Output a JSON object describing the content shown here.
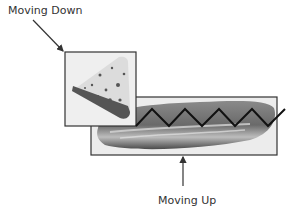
{
  "labels": {
    "top": "Moving Down",
    "bottom": "Moving Up"
  },
  "images": {
    "top_image": "cheese-wedge",
    "bottom_image": "bread-loaf"
  },
  "colors": {
    "box_border": "#333333",
    "arrow": "#333333",
    "zigzag": "#111111",
    "background": "#ffffff"
  }
}
